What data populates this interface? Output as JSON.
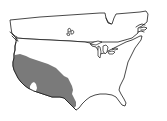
{
  "map": {
    "type": "outline-map",
    "area": "contiguous United States with southern Canada",
    "background_color": "#ffffff",
    "outline_color": "#1a1a1a",
    "shaded_region": {
      "label": "southwestern United States",
      "color": "#7a7a7a",
      "covers": [
        "California",
        "Nevada",
        "Arizona",
        "southern Utah",
        "New Mexico",
        "western Texas",
        "southern Oregon"
      ],
      "hole_color": "#ffffff"
    }
  }
}
